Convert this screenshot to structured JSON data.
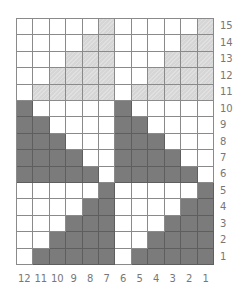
{
  "chart": {
    "title": "",
    "columns": 12,
    "rows": 15,
    "column_labels": [
      "12",
      "11",
      "10",
      "9",
      "8",
      "7",
      "6",
      "5",
      "4",
      "3",
      "2",
      "1"
    ],
    "row_labels": [
      "15",
      "14",
      "13",
      "12",
      "11",
      "10",
      "9",
      "8",
      "7",
      "6",
      "5",
      "4",
      "3",
      "2",
      "1"
    ],
    "legend": {
      "W": "white / background",
      "L": "light gray (hatched)",
      "D": "dark gray"
    },
    "colors": {
      "W": "#ffffff",
      "L": "#d6d6d6",
      "D": "#7b7b7b",
      "grid": "#8a8a8a"
    },
    "grid": [
      "WWWWWLWWWWWL",
      "WWWWLLWWWWLL",
      "WWWLLLWWWLLL",
      "WWLLLLWWLLLL",
      "WLLLLLWLLLLL",
      "DWWWWWDWWWWW",
      "DDWWWWDDWWWW",
      "DDDWWWDDDWWW",
      "DDDDWWDDDDWW",
      "DDDDDWDDDDDW",
      "WWWWWDWWWWWD",
      "WWWWDDWWWWDD",
      "WWWDDDWWWDDD",
      "WWDDDDWWDDDD",
      "WDDDDDWDDDDD"
    ]
  }
}
